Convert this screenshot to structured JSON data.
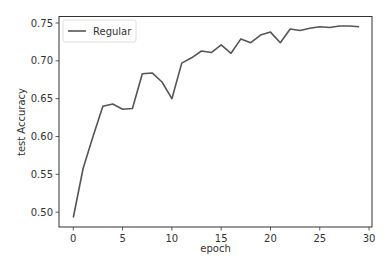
{
  "chart_data": {
    "type": "line",
    "title": "",
    "xlabel": "epoch",
    "ylabel": "test Accuracy",
    "xlim": [
      -1.45,
      30.3
    ],
    "ylim": [
      0.4804,
      0.7586
    ],
    "xticks": [
      0,
      5,
      10,
      15,
      20,
      25,
      30
    ],
    "yticks": [
      0.5,
      0.55,
      0.6,
      0.65,
      0.7,
      0.75
    ],
    "xtick_labels": [
      "0",
      "5",
      "10",
      "15",
      "20",
      "25",
      "30"
    ],
    "ytick_labels": [
      "0.50",
      "0.55",
      "0.60",
      "0.65",
      "0.70",
      "0.75"
    ],
    "grid": false,
    "legend_position": "upper left",
    "series": [
      {
        "name": "Regular",
        "color": "#555555",
        "x": [
          0,
          1,
          2,
          3,
          4,
          5,
          6,
          7,
          8,
          9,
          10,
          11,
          12,
          13,
          14,
          15,
          16,
          17,
          18,
          19,
          20,
          21,
          22,
          23,
          24,
          25,
          26,
          27,
          28,
          29
        ],
        "values": [
          0.493,
          0.558,
          0.6,
          0.64,
          0.643,
          0.636,
          0.637,
          0.683,
          0.684,
          0.672,
          0.65,
          0.697,
          0.704,
          0.713,
          0.711,
          0.721,
          0.71,
          0.729,
          0.724,
          0.734,
          0.738,
          0.724,
          0.742,
          0.74,
          0.743,
          0.745,
          0.744,
          0.746,
          0.746,
          0.745
        ]
      }
    ]
  },
  "legend": {
    "items": [
      {
        "label": "Regular"
      }
    ]
  }
}
